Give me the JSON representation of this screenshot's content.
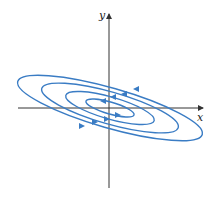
{
  "diagram": {
    "type": "phase-portrait",
    "axes": {
      "x_label": "x",
      "y_label": "y",
      "color": "#333333"
    },
    "curve_color": "#3a7cc4",
    "orbits": [
      {
        "name": "orbit-1",
        "rx": 25,
        "ry": 6
      },
      {
        "name": "orbit-2",
        "rx": 46,
        "ry": 11
      },
      {
        "name": "orbit-3",
        "rx": 71,
        "ry": 16
      },
      {
        "name": "orbit-4",
        "rx": 96,
        "ry": 20
      }
    ],
    "direction": "counterclockwise",
    "tilt_deg": -16
  }
}
